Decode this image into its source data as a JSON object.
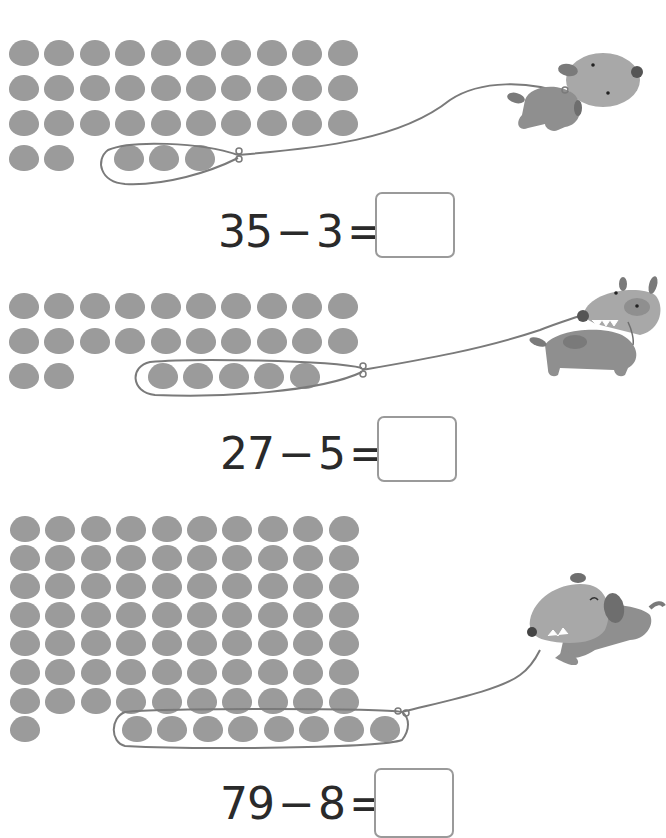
{
  "colors": {
    "dot": "#9b9b9b",
    "leash": "#7a7a7a",
    "text": "#2a2a2a",
    "box_border": "#9a9a9a",
    "dog_body": "#8f8f8f",
    "dog_head": "#a8a8a8",
    "dog_dark": "#6e6e6e"
  },
  "problems": [
    {
      "minuend": "35",
      "operator": "−",
      "subtrahend": "3",
      "equals": "=",
      "answer": "",
      "dots_total": 35,
      "dots_in_leash": 3,
      "rows": [
        10,
        10,
        10,
        5
      ],
      "dog": "walking-dog-icon"
    },
    {
      "minuend": "27",
      "operator": "−",
      "subtrahend": "5",
      "equals": "=",
      "answer": "",
      "dots_total": 27,
      "dots_in_leash": 5,
      "rows": [
        10,
        10,
        7
      ],
      "dog": "biting-dog-icon"
    },
    {
      "minuend": "79",
      "operator": "−",
      "subtrahend": "8",
      "equals": "=",
      "answer": "",
      "dots_total": 79,
      "dots_in_leash": 8,
      "rows": [
        10,
        10,
        10,
        10,
        10,
        10,
        10,
        9
      ],
      "dog": "running-dog-icon"
    }
  ]
}
